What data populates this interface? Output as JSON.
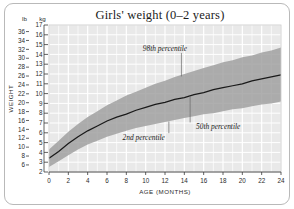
{
  "title": "Girls' weight (0–2 years)",
  "axes": {
    "y_label": "WEIGHT",
    "x_label": "AGE (MONTHS)",
    "unit_left": "lb",
    "unit_right": "kg"
  },
  "annotations": {
    "upper": "98th percentile",
    "median": "50th percentile",
    "lower": "2nd percentile"
  },
  "colors": {
    "plot_background": "#e9e9e9",
    "gridline": "#ffffff",
    "band": "#9d9d9d",
    "median_line": "#1a1a1a",
    "frame": "#b9b9b9",
    "text": "#1b1b1b"
  },
  "chart_data": {
    "type": "area",
    "title": "Girls' weight (0–2 years)",
    "xlabel": "AGE (MONTHS)",
    "ylabel": "WEIGHT",
    "grid": true,
    "legend": "annotated-inline",
    "x": [
      0,
      1,
      2,
      3,
      4,
      5,
      6,
      7,
      8,
      9,
      10,
      11,
      12,
      13,
      14,
      15,
      16,
      17,
      18,
      19,
      20,
      21,
      22,
      23,
      24
    ],
    "x_unit": "months",
    "xlim": [
      0,
      24
    ],
    "x_ticks": [
      0,
      2,
      4,
      6,
      8,
      10,
      12,
      14,
      16,
      18,
      20,
      22,
      24
    ],
    "y_unit_primary": "kg",
    "ylim_kg": [
      2,
      17
    ],
    "y_ticks_kg": [
      2,
      3,
      4,
      5,
      6,
      7,
      8,
      9,
      10,
      11,
      12,
      13,
      14,
      15,
      16,
      17
    ],
    "y_unit_secondary": "lb",
    "y_ticks_lb": [
      6,
      8,
      10,
      12,
      14,
      16,
      18,
      20,
      22,
      24,
      26,
      28,
      30,
      32,
      34,
      36
    ],
    "series": [
      {
        "name": "98th percentile",
        "unit": "kg",
        "values": [
          4.3,
          5.2,
          6.1,
          6.9,
          7.6,
          8.2,
          8.8,
          9.3,
          9.8,
          10.2,
          10.6,
          11.0,
          11.3,
          11.7,
          12.0,
          12.3,
          12.6,
          12.9,
          13.2,
          13.4,
          13.7,
          13.9,
          14.2,
          14.4,
          14.7
        ]
      },
      {
        "name": "50th percentile",
        "unit": "kg",
        "values": [
          3.4,
          4.1,
          4.9,
          5.6,
          6.2,
          6.7,
          7.2,
          7.6,
          7.9,
          8.3,
          8.6,
          8.9,
          9.1,
          9.4,
          9.6,
          9.9,
          10.1,
          10.4,
          10.6,
          10.8,
          11.0,
          11.3,
          11.5,
          11.7,
          11.9
        ]
      },
      {
        "name": "2nd percentile",
        "unit": "kg",
        "values": [
          2.5,
          3.1,
          3.7,
          4.3,
          4.8,
          5.2,
          5.6,
          5.9,
          6.2,
          6.5,
          6.7,
          6.9,
          7.1,
          7.3,
          7.5,
          7.7,
          7.9,
          8.0,
          8.2,
          8.4,
          8.5,
          8.7,
          8.9,
          9.0,
          9.2
        ]
      }
    ],
    "annotations": [
      {
        "text": "98th percentile",
        "x": 12.0,
        "y_kg": 14.3
      },
      {
        "text": "50th percentile",
        "x": 17.5,
        "y_kg": 6.4
      },
      {
        "text": "2nd percentile",
        "x": 9.8,
        "y_kg": 5.3
      }
    ]
  }
}
